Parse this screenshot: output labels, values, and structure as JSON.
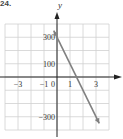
{
  "corner_label": "24.",
  "chart_data": {
    "type": "line",
    "title": "",
    "xlabel": "",
    "ylabel": "y",
    "xlim": [
      -4,
      4
    ],
    "ylim": [
      -400,
      400
    ],
    "grid": true,
    "x_ticks": [
      -3,
      -1,
      0,
      1,
      3
    ],
    "x_tick_labels": [
      "−3",
      "−1",
      "0",
      "1",
      "3"
    ],
    "y_ticks": [
      300,
      100,
      -300
    ],
    "y_tick_labels": [
      "300",
      "100",
      "−300"
    ],
    "series": [
      {
        "name": "y = −200x + 300",
        "x": [
          -0.25,
          3.25
        ],
        "y": [
          350,
          -350
        ],
        "color": "#777777"
      }
    ],
    "annotations": []
  },
  "colors": {
    "grid": "#d0d0d0",
    "axis": "#222222",
    "line": "#808080"
  }
}
